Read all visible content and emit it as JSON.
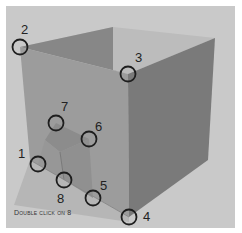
{
  "caption": "Double click on 8",
  "colors": {
    "background": "#c9c9c9",
    "top_face": "#b8b8b8",
    "back_left_face": "#8a8a8a",
    "left_wall": "#9a9a9a",
    "right_wall": "#7c7c7c",
    "inner_box_front": "#8f8f8f",
    "inner_box_side": "#858585",
    "floor": "#a9a9a9",
    "marker": "#1e1e1e"
  },
  "markers": [
    {
      "id": "1",
      "label": "1",
      "cx": 38,
      "cy": 164,
      "lx": 22,
      "ly": 155
    },
    {
      "id": "2",
      "label": "2",
      "cx": 20,
      "cy": 47,
      "lx": 22,
      "ly": 30
    },
    {
      "id": "3",
      "label": "3",
      "cx": 128,
      "cy": 74,
      "lx": 136,
      "ly": 58
    },
    {
      "id": "4",
      "label": "4",
      "cx": 129,
      "cy": 217,
      "lx": 144,
      "ly": 220
    },
    {
      "id": "5",
      "label": "5",
      "cx": 93,
      "cy": 198,
      "lx": 101,
      "ly": 189
    },
    {
      "id": "6",
      "label": "6",
      "cx": 89,
      "cy": 139,
      "lx": 95,
      "ly": 129
    },
    {
      "id": "7",
      "label": "7",
      "cx": 56,
      "cy": 123,
      "lx": 62,
      "ly": 108
    },
    {
      "id": "8",
      "label": "8",
      "cx": 64,
      "cy": 180,
      "lx": 58,
      "ly": 200
    }
  ]
}
